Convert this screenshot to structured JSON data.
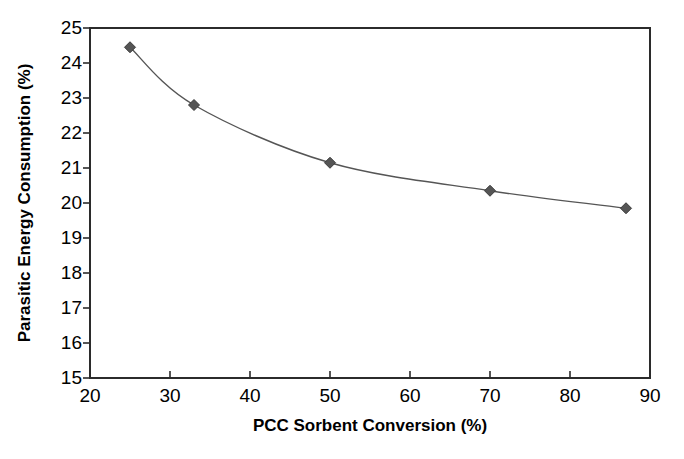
{
  "chart_data": {
    "type": "line",
    "title": "",
    "xlabel": "PCC Sorbent Conversion (%)",
    "ylabel": "Parasitic Energy Consumption (%)",
    "xlim": [
      20,
      90
    ],
    "ylim": [
      15,
      25
    ],
    "xticks": [
      20,
      30,
      40,
      50,
      60,
      70,
      80,
      90
    ],
    "yticks": [
      15,
      16,
      17,
      18,
      19,
      20,
      21,
      22,
      23,
      24,
      25
    ],
    "xtick_labels": [
      "20",
      "30",
      "40",
      "50",
      "60",
      "70",
      "80",
      "90"
    ],
    "ytick_labels": [
      "15",
      "16",
      "17",
      "18",
      "19",
      "20",
      "21",
      "22",
      "23",
      "24",
      "25"
    ],
    "grid": false,
    "legend": false,
    "legend_position": "none",
    "marker": "diamond",
    "marker_color": "#555555",
    "line_color": "#555555",
    "line_width": 1.4,
    "plot_background": "#ffffff",
    "border": true,
    "series": [
      {
        "name": "Parasitic Energy Consumption",
        "x": [
          25,
          33,
          50,
          70,
          87
        ],
        "values": [
          24.45,
          22.8,
          21.15,
          20.35,
          19.85
        ]
      }
    ]
  },
  "axes": {
    "x_title": "PCC Sorbent Conversion (%)",
    "y_title": "Parasitic Energy Consumption (%)"
  }
}
